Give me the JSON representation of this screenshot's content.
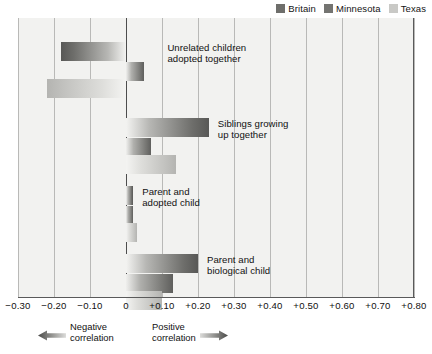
{
  "legend": {
    "position": "top-right",
    "entries": [
      {
        "label": "Britain",
        "color": "#6e6e6b",
        "series_key": "britain"
      },
      {
        "label": "Minnesota",
        "color": "#747471",
        "series_key": "minnesota"
      },
      {
        "label": "Texas",
        "color": "#c9c9c6",
        "series_key": "texas"
      }
    ]
  },
  "footer": {
    "negative": {
      "text": "Negative\ncorrelation",
      "icon": "arrow-left-icon"
    },
    "positive": {
      "text": "Positive\ncorrelation",
      "icon": "arrow-right-icon"
    }
  },
  "chart_data": {
    "type": "bar",
    "orientation": "horizontal",
    "title": "",
    "subtitle": "",
    "xlabel": "",
    "ylabel": "",
    "xlim": [
      -0.3,
      0.8
    ],
    "xticks": [
      -0.3,
      -0.2,
      -0.1,
      0,
      0.1,
      0.2,
      0.3,
      0.4,
      0.5,
      0.6,
      0.7,
      0.8
    ],
    "xticklabels": [
      "−0.30",
      "−0.20",
      "−0.10",
      "0",
      "+0.10",
      "+0.20",
      "+0.30",
      "+0.40",
      "+0.50",
      "+0.60",
      "+0.70",
      "+0.80"
    ],
    "grid": true,
    "grid_axis": "x",
    "zero_line": true,
    "legend_position": "top-right",
    "categories": [
      "Unrelated children adopted together",
      "Siblings growing up together",
      "Parent and adopted child",
      "Parent and biological child"
    ],
    "series": [
      {
        "name": "Britain",
        "values": [
          -0.18,
          0.23,
          0.02,
          0.2
        ]
      },
      {
        "name": "Minnesota",
        "values": [
          0.05,
          0.07,
          0.02,
          0.13
        ]
      },
      {
        "name": "Texas",
        "values": [
          -0.22,
          0.14,
          0.03,
          0.1
        ]
      }
    ],
    "groups": [
      {
        "label": "Unrelated children\nadopted together",
        "label_x": 0.115,
        "label_y": 42,
        "bars": [
          {
            "series": "Britain",
            "value": -0.18,
            "y": 24
          },
          {
            "series": "Minnesota",
            "value": 0.05,
            "y": 44
          },
          {
            "series": "Texas",
            "value": -0.22,
            "y": 61
          }
        ]
      },
      {
        "label": "Siblings growing\nup together",
        "label_x": 0.255,
        "label_y": 118,
        "bars": [
          {
            "series": "Britain",
            "value": 0.23,
            "y": 100
          },
          {
            "series": "Minnesota",
            "value": 0.07,
            "y": 120
          },
          {
            "series": "Texas",
            "value": 0.14,
            "y": 137
          }
        ]
      },
      {
        "label": "Parent and\nadopted child",
        "label_x": 0.045,
        "label_y": 186,
        "bars": [
          {
            "series": "Britain",
            "value": 0.02,
            "y": 168
          },
          {
            "series": "Minnesota",
            "value": 0.02,
            "y": 188
          },
          {
            "series": "Texas",
            "value": 0.03,
            "y": 205
          }
        ]
      },
      {
        "label": "Parent and\nbiological child",
        "label_x": 0.225,
        "label_y": 254,
        "bars": [
          {
            "series": "Britain",
            "value": 0.2,
            "y": 236
          },
          {
            "series": "Minnesota",
            "value": 0.13,
            "y": 256
          },
          {
            "series": "Texas",
            "value": 0.1,
            "y": 273
          }
        ]
      }
    ]
  }
}
